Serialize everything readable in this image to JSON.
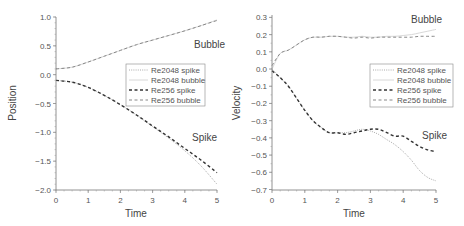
{
  "chart_data": [
    {
      "type": "line",
      "title": "",
      "xlabel": "Time",
      "ylabel": "Position",
      "xlim": [
        0,
        5
      ],
      "ylim": [
        -2.25,
        1.25
      ],
      "xticks": [
        "0",
        "1",
        "2",
        "3",
        "4",
        "5"
      ],
      "yticks": [
        "1.0",
        "0.5",
        "0.0",
        "−0.5",
        "−1.0",
        "−1.5",
        "−2.0"
      ],
      "grid": false,
      "legend_position": "upper right (inside)",
      "annotations": [
        "Bubble",
        "Spike"
      ],
      "x": [
        0,
        0.5,
        1,
        1.5,
        2,
        2.5,
        3,
        3.5,
        4,
        4.5,
        5
      ],
      "series": [
        {
          "name": "Re2048 spike",
          "style": "dotted",
          "values": [
            -0.1,
            -0.13,
            -0.22,
            -0.36,
            -0.52,
            -0.7,
            -0.9,
            -1.1,
            -1.32,
            -1.58,
            -1.9
          ]
        },
        {
          "name": "Re2048 bubble",
          "style": "solid-light",
          "values": [
            0.1,
            0.13,
            0.22,
            0.32,
            0.42,
            0.52,
            0.6,
            0.68,
            0.76,
            0.85,
            0.95
          ]
        },
        {
          "name": "Re256 spike",
          "style": "dashed-dark",
          "values": [
            -0.1,
            -0.13,
            -0.22,
            -0.36,
            -0.52,
            -0.7,
            -0.89,
            -1.08,
            -1.28,
            -1.48,
            -1.7
          ]
        },
        {
          "name": "Re256 bubble",
          "style": "dashed-light",
          "values": [
            0.1,
            0.13,
            0.22,
            0.32,
            0.42,
            0.52,
            0.6,
            0.68,
            0.76,
            0.85,
            0.94
          ]
        }
      ]
    },
    {
      "type": "line",
      "title": "",
      "xlabel": "Time",
      "ylabel": "Velocity",
      "xlim": [
        0,
        5
      ],
      "ylim": [
        -0.7,
        0.3
      ],
      "xticks": [
        "0",
        "1",
        "2",
        "3",
        "4",
        "5"
      ],
      "yticks": [
        "0.3",
        "0.2",
        "0.1",
        "0.0",
        "−0.1",
        "−0.2",
        "−0.3",
        "−0.4",
        "−0.5",
        "−0.6",
        "−0.7"
      ],
      "grid": false,
      "legend_position": "center right (inside)",
      "annotations": [
        "Bubble",
        "Spike"
      ],
      "x": [
        0,
        0.25,
        0.5,
        0.75,
        1,
        1.25,
        1.5,
        1.75,
        2,
        2.25,
        2.5,
        2.75,
        3,
        3.25,
        3.5,
        3.75,
        4,
        4.25,
        4.5,
        4.75,
        5
      ],
      "series": [
        {
          "name": "Re2048 spike",
          "style": "dotted",
          "values": [
            0.0,
            -0.05,
            -0.1,
            -0.17,
            -0.24,
            -0.3,
            -0.34,
            -0.37,
            -0.37,
            -0.37,
            -0.36,
            -0.35,
            -0.36,
            -0.38,
            -0.41,
            -0.44,
            -0.48,
            -0.53,
            -0.59,
            -0.63,
            -0.65
          ]
        },
        {
          "name": "Re2048 bubble",
          "style": "solid-light",
          "values": [
            0.0,
            0.09,
            0.11,
            0.14,
            0.17,
            0.185,
            0.185,
            0.19,
            0.19,
            0.185,
            0.185,
            0.19,
            0.185,
            0.185,
            0.19,
            0.19,
            0.195,
            0.2,
            0.21,
            0.22,
            0.23
          ]
        },
        {
          "name": "Re256 spike",
          "style": "dashed-dark",
          "values": [
            -0.01,
            -0.05,
            -0.1,
            -0.17,
            -0.24,
            -0.3,
            -0.34,
            -0.37,
            -0.37,
            -0.38,
            -0.37,
            -0.36,
            -0.35,
            -0.35,
            -0.37,
            -0.39,
            -0.39,
            -0.42,
            -0.45,
            -0.47,
            -0.48
          ]
        },
        {
          "name": "Re256 bubble",
          "style": "dashed-light",
          "values": [
            0.02,
            0.09,
            0.11,
            0.14,
            0.17,
            0.185,
            0.185,
            0.19,
            0.19,
            0.185,
            0.18,
            0.185,
            0.18,
            0.185,
            0.185,
            0.185,
            0.185,
            0.185,
            0.19,
            0.19,
            0.19
          ]
        }
      ]
    }
  ],
  "left": {
    "ylabel": "Position",
    "xlabel": "Time",
    "annotation_bubble": "Bubble",
    "annotation_spike": "Spike",
    "yticks": [
      "1.0",
      "0.5",
      "0.0",
      "−0.5",
      "−1.0",
      "−1.5",
      "−2.0"
    ],
    "xticks": [
      "0",
      "1",
      "2",
      "3",
      "4",
      "5"
    ],
    "legend": [
      "Re2048 spike",
      "Re2048 bubble",
      "Re256 spike",
      "Re256 bubble"
    ]
  },
  "right": {
    "ylabel": "Velocity",
    "xlabel": "Time",
    "annotation_bubble": "Bubble",
    "annotation_spike": "Spike",
    "yticks": [
      "0.3",
      "0.2",
      "0.1",
      "0.0",
      "−0.1",
      "−0.2",
      "−0.3",
      "−0.4",
      "−0.5",
      "−0.6",
      "−0.7"
    ],
    "xticks": [
      "0",
      "1",
      "2",
      "3",
      "4",
      "5"
    ],
    "legend": [
      "Re2048 spike",
      "Re2048 bubble",
      "Re256 spike",
      "Re256 bubble"
    ]
  },
  "styles": {
    "axis_color": "#777777",
    "re2048_spike_color": "#aaaaaa",
    "re2048_bubble_color": "#d8d8d8",
    "re256_spike_color": "#333333",
    "re256_bubble_color": "#888888"
  }
}
